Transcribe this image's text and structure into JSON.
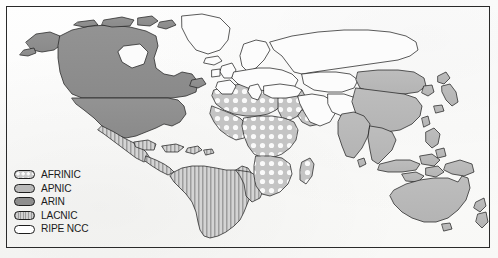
{
  "figure": {
    "type": "choropleth-world-map",
    "border_color": "#2a2a2a",
    "background_color": "#fdfdfc"
  },
  "legend": {
    "position": "bottom-left",
    "items": [
      {
        "id": "afrinic",
        "label": "AFRINIC",
        "pattern": "dotted",
        "fill": "#c9c9c9",
        "dot_color": "#fbfbfb",
        "regions": [
          "Africa"
        ]
      },
      {
        "id": "apnic",
        "label": "APNIC",
        "pattern": "solid",
        "fill": "#b9b9b9",
        "regions": [
          "Asia",
          "Australia",
          "New Zealand",
          "Pacific"
        ]
      },
      {
        "id": "arin",
        "label": "ARIN",
        "pattern": "solid",
        "fill": "#8e8e8e",
        "regions": [
          "United States",
          "Canada"
        ]
      },
      {
        "id": "lacnic",
        "label": "LACNIC",
        "pattern": "vertical-stripes",
        "fill": "#cfcfcf",
        "stripe_color": "#9a9a9a",
        "regions": [
          "South America",
          "Central America",
          "Mexico",
          "Caribbean"
        ]
      },
      {
        "id": "ripencc",
        "label": "RIPE NCC",
        "pattern": "none",
        "fill": "#ffffff",
        "regions": [
          "Europe",
          "Russia",
          "Middle East",
          "Central Asia",
          "Greenland"
        ]
      }
    ]
  },
  "map_regions": {
    "arin": [
      "Canada",
      "United States",
      "Greenland-adjacent Arctic isles"
    ],
    "lacnic": [
      "Mexico",
      "Central America",
      "Caribbean",
      "Brazil",
      "Argentina",
      "Chile",
      "Peru",
      "Colombia",
      "Venezuela",
      "Bolivia",
      "Paraguay",
      "Uruguay",
      "Ecuador",
      "Guyana"
    ],
    "afrinic": [
      "Morocco",
      "Algeria",
      "Libya",
      "Egypt",
      "Sudan",
      "Ethiopia",
      "Kenya",
      "Nigeria",
      "Niger",
      "Mali",
      "Chad",
      "DR Congo",
      "Angola",
      "Zambia",
      "Tanzania",
      "South Africa",
      "Madagascar"
    ],
    "ripencc": [
      "Iceland",
      "Greenland",
      "Norway",
      "Sweden",
      "Finland",
      "United Kingdom",
      "Ireland",
      "France",
      "Spain",
      "Portugal",
      "Germany",
      "Poland",
      "Italy",
      "Greece",
      "Turkey",
      "Ukraine",
      "Russia",
      "Kazakhstan",
      "Saudi Arabia",
      "Iran",
      "Iraq"
    ],
    "apnic": [
      "China",
      "Mongolia",
      "India",
      "Pakistan",
      "Japan",
      "Korea",
      "Vietnam",
      "Thailand",
      "Myanmar",
      "Indonesia",
      "Philippines",
      "Malaysia",
      "Papua New Guinea",
      "Australia",
      "New Zealand"
    ]
  }
}
